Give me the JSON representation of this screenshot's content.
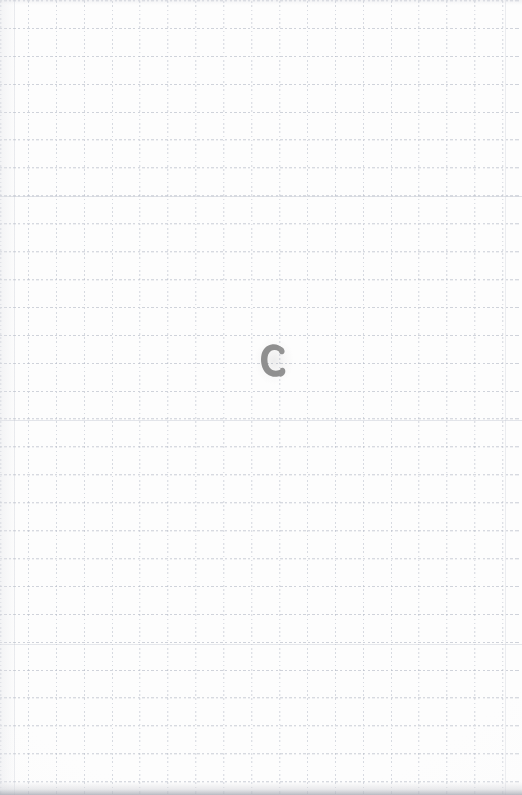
{
  "image": {
    "kind": "scanned-graph-paper-sheet",
    "width": 522,
    "height": 795,
    "description": "Scan of a blank sheet of square graph paper with a single hand-drawn letter near the centre",
    "background_color": "#fdfdfd",
    "paper_tint": "#ffffff"
  },
  "grid": {
    "name": "graph-paper-grid",
    "cell_size_px": 28,
    "line_style": "dotted",
    "line_color": "#b4bac6",
    "columns": 19,
    "rows": 29,
    "orientation": "square"
  },
  "mark": {
    "name": "handwritten-letter",
    "character": "C",
    "style": "bold rounded marker capital",
    "color": "#8b8b8b",
    "position": {
      "x": 258,
      "y": 341
    },
    "size": {
      "width": 32,
      "height": 40
    }
  },
  "edges": {
    "bottom_shadow_color": "#a6a8b1",
    "left_shadow_color": "#e4e5e9"
  }
}
